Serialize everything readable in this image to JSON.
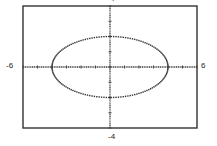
{
  "chart_data": {
    "type": "line",
    "title": "",
    "xlabel": "",
    "ylabel": "",
    "xlim": [
      -6,
      6
    ],
    "ylim": [
      -4,
      4
    ],
    "xscale": 1,
    "yscale": 1,
    "grid": false,
    "legend": null,
    "tick_labels": {
      "xmin": "-6",
      "xmax": "6",
      "ymin": "-4",
      "ymax": "4"
    },
    "series": [
      {
        "name": "ellipse",
        "equation": "x^2/16 + y^2/4 = 1",
        "center": [
          0,
          0
        ],
        "semi_major_x": 4,
        "semi_minor_y": 2,
        "style": "dotted"
      }
    ]
  },
  "colors": {
    "frame": "#333333",
    "axis": "#444444",
    "curve": "#333333",
    "background": "#ffffff"
  }
}
